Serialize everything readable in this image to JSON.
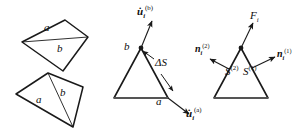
{
  "figure": {
    "background": "#ffffff",
    "stroke": "#1a1a1a",
    "panels": [
      {
        "name": "quadrilaterals",
        "description": "Two quadrilaterals each split by a diagonal into regions a and b",
        "shapes": [
          {
            "name": "upper-quadrilateral",
            "points": "22,42 65,20 88,37 63,71",
            "diagonal": "22,42 88,37",
            "labels": [
              {
                "text": "a",
                "x": 45,
                "y": 27
              },
              {
                "text": "b",
                "x": 57,
                "y": 48
              }
            ]
          },
          {
            "name": "lower-quadrilateral",
            "points": "16,94 48,73 83,87 73,127",
            "diagonal": "48,73 73,127",
            "labels": [
              {
                "text": "a",
                "x": 37,
                "y": 99
              },
              {
                "text": "b",
                "x": 61,
                "y": 92
              }
            ]
          }
        ]
      },
      {
        "name": "kinematics-triangle",
        "description": "Triangle with vertex b at apex, vertex a at lower right, velocity vectors and interface delta-S",
        "triangle": "141,48 114,98 168,98",
        "vertex_labels": [
          {
            "text": "b",
            "x": 125,
            "y": 44
          },
          {
            "text": "a",
            "x": 157,
            "y": 100
          }
        ],
        "vectors": [
          {
            "name": "velocity-b",
            "label": "u̇",
            "sub": "i",
            "sup": "(b)",
            "x1": 141,
            "y1": 48,
            "x2": 152,
            "y2": 20
          },
          {
            "name": "velocity-a",
            "label": "u̇",
            "sub": "i",
            "sup": "(a)",
            "x1": 168,
            "y1": 98,
            "x2": 190,
            "y2": 115
          }
        ],
        "interface": {
          "name": "delta-s",
          "label": "ΔS",
          "x": 158,
          "y": 62,
          "arrow_up": {
            "x1": 153,
            "y1": 58,
            "x2": 142,
            "y2": 51
          },
          "arrow_down": {
            "x1": 162,
            "y1": 74,
            "x2": 173,
            "y2": 92
          }
        }
      },
      {
        "name": "traction-triangle",
        "description": "Triangle with outward unit normals, surface patches and resultant force",
        "triangle": "241,48 214,98 268,98",
        "vectors": [
          {
            "name": "force",
            "label": "F",
            "sub": "i",
            "sup": "",
            "x1": 241,
            "y1": 48,
            "x2": 254,
            "y2": 22
          },
          {
            "name": "normal-2",
            "label": "n",
            "sub": "i",
            "sup": "(2)",
            "x1": 228,
            "y1": 69,
            "x2": 208,
            "y2": 58
          },
          {
            "name": "normal-1",
            "label": "n",
            "sub": "i",
            "sup": "(1)",
            "x1": 253,
            "y1": 67,
            "x2": 277,
            "y2": 56
          }
        ],
        "surface_labels": [
          {
            "name": "surface-2",
            "label": "S",
            "sup": "(2)",
            "x": 227,
            "y": 70
          },
          {
            "name": "surface-1",
            "label": "S",
            "sup": "(1)",
            "x": 244,
            "y": 70
          }
        ]
      }
    ]
  }
}
